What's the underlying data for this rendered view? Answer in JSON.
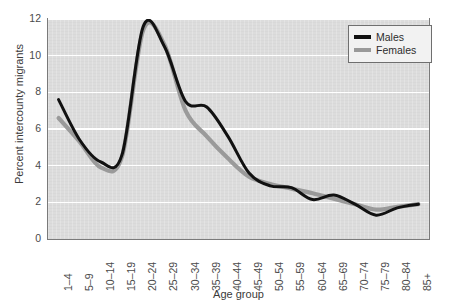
{
  "chart_data": {
    "type": "line",
    "title": "",
    "xlabel": "Age group",
    "ylabel": "Percent intercounty migrants",
    "ylim": [
      0,
      12
    ],
    "yticks": [
      0,
      2,
      4,
      6,
      8,
      10,
      12
    ],
    "grid": "horizontal",
    "legend_position": "top-right",
    "smoothing": "spline",
    "categories": [
      "1–4",
      "5–9",
      "10–14",
      "15–19",
      "20–24",
      "25–29",
      "30–34",
      "35–39",
      "40–44",
      "45–49",
      "50–54",
      "55–59",
      "60–64",
      "65–69",
      "70–74",
      "75–79",
      "80–84",
      "85+"
    ],
    "series": [
      {
        "name": "Males",
        "color": "#111111",
        "width": 3.0,
        "values": [
          7.6,
          5.4,
          4.2,
          4.6,
          11.6,
          10.5,
          7.5,
          7.2,
          5.6,
          3.6,
          2.9,
          2.8,
          2.15,
          2.4,
          1.9,
          1.3,
          1.7,
          1.9
        ]
      },
      {
        "name": "Females",
        "color": "#9a9a9a",
        "width": 4.2,
        "values": [
          6.6,
          5.3,
          3.9,
          4.5,
          11.4,
          10.6,
          7.0,
          5.6,
          4.4,
          3.4,
          3.0,
          2.75,
          2.5,
          2.2,
          1.9,
          1.6,
          1.75,
          1.9
        ]
      }
    ]
  },
  "legend": {
    "items": [
      {
        "label": "Males"
      },
      {
        "label": "Females"
      }
    ]
  },
  "axes": {
    "y_title": "Percent intercounty migrants",
    "x_title": "Age group"
  },
  "colors": {
    "plot_background": "#dcdcdc",
    "gridline": "#ffffff",
    "frame": "#7a7a7a",
    "males": "#111111",
    "females": "#9a9a9a",
    "text": "#3a3a3a"
  }
}
